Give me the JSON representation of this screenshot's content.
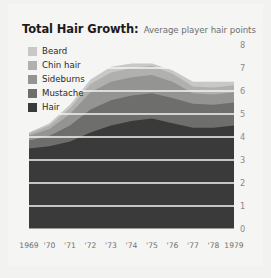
{
  "title": {
    "main": "Total Hair Growth:",
    "sub": "Average player hair points"
  },
  "legend": {
    "items": [
      {
        "label": "Beard",
        "color": "#c8c8c6"
      },
      {
        "label": "Chin hair",
        "color": "#b0b0ae"
      },
      {
        "label": "Sideburns",
        "color": "#949492"
      },
      {
        "label": "Mustache",
        "color": "#6e6e6c"
      },
      {
        "label": "Hair",
        "color": "#3a3a3a"
      }
    ]
  },
  "axes": {
    "y_ticks": [
      "0",
      "1",
      "2",
      "3",
      "4",
      "5",
      "6",
      "7",
      "8"
    ],
    "x_ticks": [
      "1969",
      "'70",
      "'71",
      "'72",
      "'73",
      "'74",
      "'75",
      "'76",
      "'77",
      "'78",
      "1979"
    ]
  },
  "chart_data": {
    "type": "area",
    "stacked": true,
    "title": "Total Hair Growth:",
    "subtitle": "Average player hair points",
    "xlabel": "",
    "ylabel": "",
    "ylim": [
      0,
      8
    ],
    "grid": true,
    "y_axis_position": "right",
    "legend_position": "top-left",
    "categories": [
      "1969",
      "1970",
      "1971",
      "1972",
      "1973",
      "1974",
      "1975",
      "1976",
      "1977",
      "1978",
      "1979"
    ],
    "tick_labels": [
      "1969",
      "'70",
      "'71",
      "'72",
      "'73",
      "'74",
      "'75",
      "'76",
      "'77",
      "'78",
      "1979"
    ],
    "series": [
      {
        "name": "Hair",
        "color": "#3a3a3a",
        "values": [
          3.5,
          3.6,
          3.8,
          4.2,
          4.5,
          4.7,
          4.8,
          4.6,
          4.4,
          4.4,
          4.5
        ]
      },
      {
        "name": "Mustache",
        "color": "#6e6e6c",
        "values": [
          0.35,
          0.45,
          0.7,
          1.0,
          1.1,
          1.1,
          1.1,
          1.1,
          1.05,
          1.0,
          1.0
        ]
      },
      {
        "name": "Sideburns",
        "color": "#949492",
        "values": [
          0.2,
          0.3,
          0.5,
          0.75,
          0.8,
          0.8,
          0.8,
          0.7,
          0.45,
          0.45,
          0.45
        ]
      },
      {
        "name": "Chin hair",
        "color": "#b0b0ae",
        "values": [
          0.1,
          0.15,
          0.25,
          0.35,
          0.4,
          0.4,
          0.4,
          0.35,
          0.3,
          0.3,
          0.3
        ]
      },
      {
        "name": "Beard",
        "color": "#c8c8c6",
        "values": [
          0.05,
          0.1,
          0.15,
          0.2,
          0.25,
          0.2,
          0.1,
          0.15,
          0.2,
          0.25,
          0.15
        ]
      }
    ],
    "totals": [
      4.2,
      4.6,
      5.4,
      6.5,
      7.05,
      7.2,
      7.2,
      6.9,
      6.4,
      6.4,
      6.4
    ]
  }
}
